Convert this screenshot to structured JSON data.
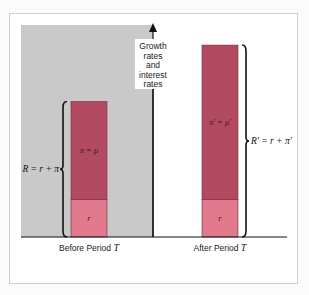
{
  "chart_data": {
    "type": "bar",
    "title": "",
    "ylabel": "Growth rates and interest rates",
    "ylabel_lines": [
      "Growth",
      "rates",
      "and",
      "interest",
      "rates"
    ],
    "categories": [
      "Before Period T",
      "After Period T"
    ],
    "category_labels": [
      {
        "text": "Before Period ",
        "var": "T"
      },
      {
        "text": "After Period ",
        "var": "T"
      }
    ],
    "series": [
      {
        "name": "r",
        "values": [
          1,
          1
        ],
        "labels": [
          "r",
          "r"
        ],
        "color": "#e07a8c"
      },
      {
        "name": "inflation",
        "values": [
          2.6,
          4.1
        ],
        "labels": [
          "π = μ",
          "π′ = μ′"
        ],
        "color": "#b24a62"
      }
    ],
    "brackets": [
      {
        "category": 0,
        "side": "left",
        "label": "R = r + π"
      },
      {
        "category": 1,
        "side": "right",
        "label": "R′ = r + π′"
      }
    ],
    "shaded_region": {
      "category": 0,
      "color": "#c9c9c9"
    },
    "ylim": [
      0,
      5.5
    ],
    "grid": false,
    "legend": "none"
  }
}
